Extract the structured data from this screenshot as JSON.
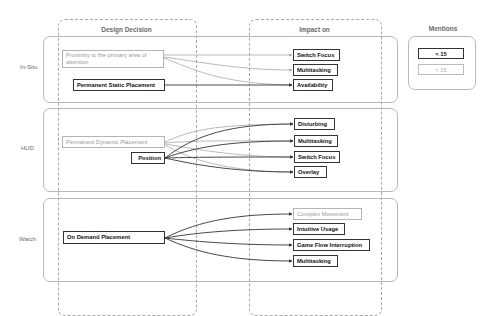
{
  "columns": {
    "design_decision": "Design Decision",
    "impact_on": "Impact on"
  },
  "rows": [
    {
      "label": "In-Situ"
    },
    {
      "label": "HUD"
    },
    {
      "label": "Watch"
    }
  ],
  "legend": {
    "title": "Mentions",
    "items": [
      {
        "label": "< 15",
        "style": "dark"
      },
      {
        "label": "> 15",
        "style": "light"
      }
    ]
  },
  "nodes": {
    "insitu_proximity": "Proximity to the primary area of attention",
    "insitu_static": "Permanent Static Placement",
    "insitu_switch_focus": "Switch Focus",
    "insitu_multitasking": "Multitasking",
    "insitu_availability": "Availability",
    "hud_dynamic": "Permanent Dynamic Placement",
    "hud_position": "Position",
    "hud_disturbing": "Disturbing",
    "hud_multitasking": "Multitasking",
    "hud_switch_focus": "Switch Focus",
    "hud_overlay": "Overlay",
    "watch_on_demand": "On Demand Placement",
    "watch_complex_movement": "Complex Movement",
    "watch_intuitive_usage": "Intuitive Usage",
    "watch_game_flow": "Game Flow Interruption",
    "watch_multitasking": "Multitasking"
  },
  "edges": [
    {
      "from": "Proximity to the primary area of attention",
      "to": "Switch Focus",
      "style": "light"
    },
    {
      "from": "Proximity to the primary area of attention",
      "to": "Multitasking",
      "style": "light"
    },
    {
      "from": "Proximity to the primary area of attention",
      "to": "Availability",
      "style": "light"
    },
    {
      "from": "Permanent Static Placement",
      "to": "Availability",
      "style": "dark"
    },
    {
      "from": "Permanent Dynamic Placement",
      "to": "Disturbing",
      "style": "light"
    },
    {
      "from": "Permanent Dynamic Placement",
      "to": "Multitasking",
      "style": "light"
    },
    {
      "from": "Permanent Dynamic Placement",
      "to": "Switch Focus",
      "style": "light"
    },
    {
      "from": "Permanent Dynamic Placement",
      "to": "Overlay",
      "style": "light"
    },
    {
      "from": "Position",
      "to": "Disturbing",
      "style": "dark"
    },
    {
      "from": "Position",
      "to": "Multitasking",
      "style": "dark"
    },
    {
      "from": "Position",
      "to": "Switch Focus",
      "style": "dark"
    },
    {
      "from": "Position",
      "to": "Overlay",
      "style": "dark"
    },
    {
      "from": "On Demand Placement",
      "to": "Complex Movement",
      "style": "dark"
    },
    {
      "from": "On Demand Placement",
      "to": "Intuitive Usage",
      "style": "dark"
    },
    {
      "from": "On Demand Placement",
      "to": "Game Flow Interruption",
      "style": "dark"
    },
    {
      "from": "On Demand Placement",
      "to": "Multitasking",
      "style": "dark"
    }
  ],
  "colors": {
    "dark_edge": "#333333",
    "light_edge": "#a8a8a8"
  }
}
